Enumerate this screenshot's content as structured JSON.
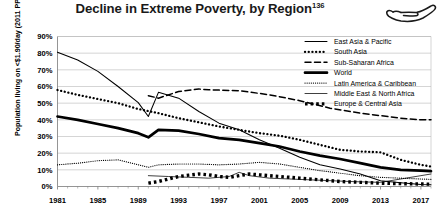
{
  "title": {
    "text": "Decline in Extreme Poverty, by Region",
    "footnote": "136"
  },
  "icon": {
    "name": "hand-icon"
  },
  "chart_data": {
    "type": "line",
    "title": "Decline in Extreme Poverty, by Region",
    "xlabel": "",
    "ylabel": "Population living on <$1.90/day (2011 PPP)",
    "xlim": [
      1981,
      2018
    ],
    "ylim": [
      0,
      90
    ],
    "grid": true,
    "legend_position": "top-right",
    "ytick_labels": [
      "0%",
      "10%",
      "20%",
      "30%",
      "40%",
      "50%",
      "60%",
      "70%",
      "80%",
      "90%"
    ],
    "ytick_values": [
      0,
      10,
      20,
      30,
      40,
      50,
      60,
      70,
      80,
      90
    ],
    "xtick_labels": [
      "1981",
      "1985",
      "1989",
      "1993",
      "1997",
      "2001",
      "2005",
      "2009",
      "2013",
      "2017"
    ],
    "xtick_values": [
      1981,
      1985,
      1989,
      1993,
      1997,
      2001,
      2005,
      2009,
      2013,
      2017
    ],
    "series": [
      {
        "name": "East Asia & Pacific",
        "style": "solid-thin",
        "x": [
          1981,
          1983,
          1985,
          1987,
          1989,
          1990,
          1991,
          1993,
          1995,
          1997,
          1999,
          2001,
          2003,
          2005,
          2007,
          2009,
          2011,
          2013,
          2015,
          2017,
          2018
        ],
        "y": [
          80.6,
          75.9,
          69.1,
          60.0,
          50.3,
          42.0,
          56.5,
          53.0,
          45.0,
          38.0,
          34.0,
          28.0,
          23.0,
          17.5,
          13.0,
          10.5,
          7.5,
          3.5,
          2.3,
          1.2,
          1.0
        ]
      },
      {
        "name": "South Asia",
        "style": "dotted-thick",
        "x": [
          1981,
          1983,
          1985,
          1987,
          1989,
          1991,
          1993,
          1995,
          1997,
          1999,
          2001,
          2003,
          2005,
          2007,
          2009,
          2011,
          2013,
          2015,
          2017,
          2018
        ],
        "y": [
          57.9,
          55.0,
          52.5,
          50.0,
          46.5,
          44.0,
          41.0,
          38.5,
          36.0,
          34.0,
          32.0,
          30.5,
          28.0,
          25.0,
          22.0,
          21.0,
          20.5,
          16.0,
          13.0,
          12.0
        ]
      },
      {
        "name": "Sub-Saharan Africa",
        "style": "dashed",
        "x": [
          1990,
          1991,
          1993,
          1995,
          1996,
          1999,
          2002,
          2005,
          2008,
          2010,
          2011,
          2013,
          2015,
          2017,
          2018
        ],
        "y": [
          54.5,
          53.0,
          57.0,
          58.5,
          58.0,
          57.5,
          55.0,
          51.5,
          47.0,
          45.0,
          44.0,
          42.5,
          41.0,
          40.0,
          40.0
        ]
      },
      {
        "name": "World",
        "style": "solid-thick",
        "x": [
          1981,
          1983,
          1985,
          1987,
          1989,
          1990,
          1991,
          1993,
          1995,
          1997,
          1999,
          2001,
          2003,
          2005,
          2007,
          2009,
          2011,
          2013,
          2015,
          2017,
          2018
        ],
        "y": [
          42.0,
          40.0,
          37.5,
          35.0,
          32.0,
          29.5,
          34.0,
          33.5,
          31.5,
          29.0,
          28.0,
          26.0,
          24.0,
          21.0,
          18.5,
          16.5,
          14.0,
          11.5,
          10.0,
          9.5,
          9.2
        ]
      },
      {
        "name": "Latin America & Caribbean",
        "style": "dotted-fine",
        "x": [
          1981,
          1983,
          1985,
          1987,
          1989,
          1990,
          1991,
          1993,
          1995,
          1997,
          1999,
          2001,
          2003,
          2005,
          2007,
          2009,
          2011,
          2013,
          2015,
          2017,
          2018
        ],
        "y": [
          13.0,
          14.0,
          15.5,
          16.0,
          13.0,
          11.5,
          13.0,
          13.5,
          13.5,
          13.0,
          13.5,
          14.5,
          13.5,
          11.5,
          9.5,
          8.0,
          6.5,
          5.5,
          5.0,
          4.5,
          4.3
        ]
      },
      {
        "name": "Middle East & North Africa",
        "style": "solid-hair",
        "x": [
          1990,
          1992,
          1994,
          1996,
          1998,
          1999,
          2000,
          2002,
          2004,
          2006,
          2008,
          2010,
          2011,
          2013,
          2015,
          2017,
          2018
        ],
        "y": [
          6.5,
          6.0,
          5.5,
          5.0,
          6.0,
          8.5,
          6.5,
          5.0,
          4.5,
          4.0,
          3.5,
          3.0,
          2.8,
          2.5,
          4.5,
          6.5,
          7.5
        ]
      },
      {
        "name": "Europe & Central Asia",
        "style": "dotted-square",
        "x": [
          1990,
          1991,
          1992,
          1993,
          1994,
          1995,
          1996,
          1997,
          1998,
          1999,
          2000,
          2001,
          2002,
          2003,
          2005,
          2007,
          2009,
          2011,
          2013,
          2015,
          2017,
          2018
        ],
        "y": [
          2.0,
          3.0,
          4.5,
          6.0,
          6.8,
          7.5,
          7.0,
          6.0,
          5.5,
          6.5,
          7.5,
          7.0,
          6.5,
          6.0,
          5.0,
          4.0,
          3.0,
          2.5,
          2.0,
          1.7,
          1.5,
          1.4
        ]
      }
    ]
  },
  "legend": {
    "items": [
      {
        "label": "East Asia & Pacific",
        "style": "solid-thin"
      },
      {
        "label": "South Asia",
        "style": "dotted-thick"
      },
      {
        "label": "Sub-Saharan Africa",
        "style": "dashed"
      },
      {
        "label": "World",
        "style": "solid-thick"
      },
      {
        "label": "Latin America & Caribbean",
        "style": "dotted-fine"
      },
      {
        "label": "Middle East & North Africa",
        "style": "solid-hair"
      },
      {
        "label": "Europe & Central Asia",
        "style": "dotted-square"
      }
    ]
  }
}
